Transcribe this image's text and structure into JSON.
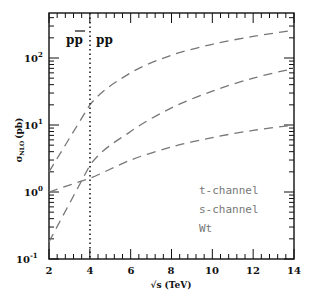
{
  "chart_data": {
    "type": "line",
    "title": "",
    "xlabel": "√s (TeV)",
    "ylabel": "σ_NLO (pb)",
    "xlim": [
      2,
      14
    ],
    "ylim": [
      0.1,
      470
    ],
    "yscale": "log",
    "x_ticks": [
      "2",
      "4",
      "6",
      "8",
      "10",
      "12",
      "14"
    ],
    "y_ticks": [
      "10^-1",
      "10^0",
      "10^1",
      "10^2"
    ],
    "grid": false,
    "legend_position": "lower right",
    "annotations": [
      {
        "text": "pp̄",
        "position": "left of √s=4"
      },
      {
        "text": "pp",
        "position": "right of √s=4"
      },
      {
        "type": "vertical-dotted-line",
        "x": 4
      }
    ],
    "x": [
      2,
      4,
      6,
      8,
      10,
      12,
      14
    ],
    "series": [
      {
        "name": "t-channel",
        "style": "dashed",
        "values": [
          2.0,
          20,
          60,
          110,
          160,
          210,
          260
        ]
      },
      {
        "name": "s-channel",
        "style": "dashed",
        "values": [
          0.18,
          2.5,
          8,
          18,
          32,
          50,
          70
        ]
      },
      {
        "name": "Wt",
        "style": "dashed",
        "values": [
          1.0,
          1.6,
          3.0,
          4.7,
          6.5,
          8.3,
          10
        ]
      }
    ]
  },
  "labels": {
    "x_axis": "√s (TeV)",
    "y_sigma": "σ",
    "y_sub": "NLO",
    "y_unit": "(pb)",
    "ppbar": "pp",
    "pp": "pp",
    "legend": [
      "t-channel",
      "s-channel",
      "Wt"
    ],
    "xticks": [
      "2",
      "4",
      "6",
      "8",
      "10",
      "12",
      "14"
    ],
    "ytick_base": "10",
    "ytick_exp": [
      "-1",
      "0",
      "1",
      "2"
    ]
  }
}
